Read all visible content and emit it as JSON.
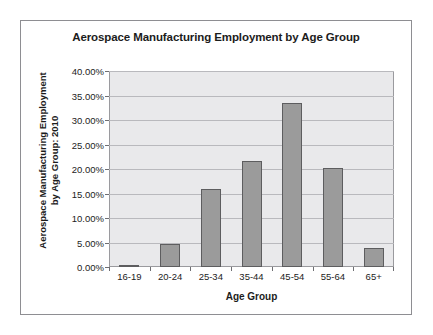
{
  "chart_data": {
    "type": "bar",
    "title": "Aerospace Manufacturing Employment by Age Group",
    "xlabel": "Age Group",
    "ylabel_lines": [
      "Aerospace Manufacturing Employment",
      "by Age Group: 2010"
    ],
    "ylabel": "Aerospace Manufacturing Employment by Age Group: 2010",
    "categories": [
      "16-19",
      "20-24",
      "25-34",
      "35-44",
      "45-54",
      "55-64",
      "65+"
    ],
    "values": [
      0.4,
      4.7,
      15.9,
      21.6,
      33.5,
      20.2,
      3.9
    ],
    "value_labels": [
      "0.40%",
      "4.70%",
      "15.90%",
      "21.60%",
      "33.50%",
      "20.20%",
      "3.90%"
    ],
    "ylim": [
      0,
      40
    ],
    "ytick_values": [
      0,
      5,
      10,
      15,
      20,
      25,
      30,
      35,
      40
    ],
    "ytick_labels": [
      "0.00%",
      "5.00%",
      "10.00%",
      "15.00%",
      "20.00%",
      "25.00%",
      "30.00%",
      "35.00%",
      "40.00%"
    ],
    "grid": true,
    "legend": false,
    "series_name": "Aerospace Manufacturing Employment by Age Group: 2010",
    "colors": {
      "bar_fill": "#9b9b9b",
      "bar_border": "#5d5d5f",
      "plot_background": "#e9e9eb",
      "gridline": "#b9b9bd",
      "text": "#1c1c1c",
      "frame_border": "#8e8e92",
      "page_background": "#ffffff"
    }
  }
}
